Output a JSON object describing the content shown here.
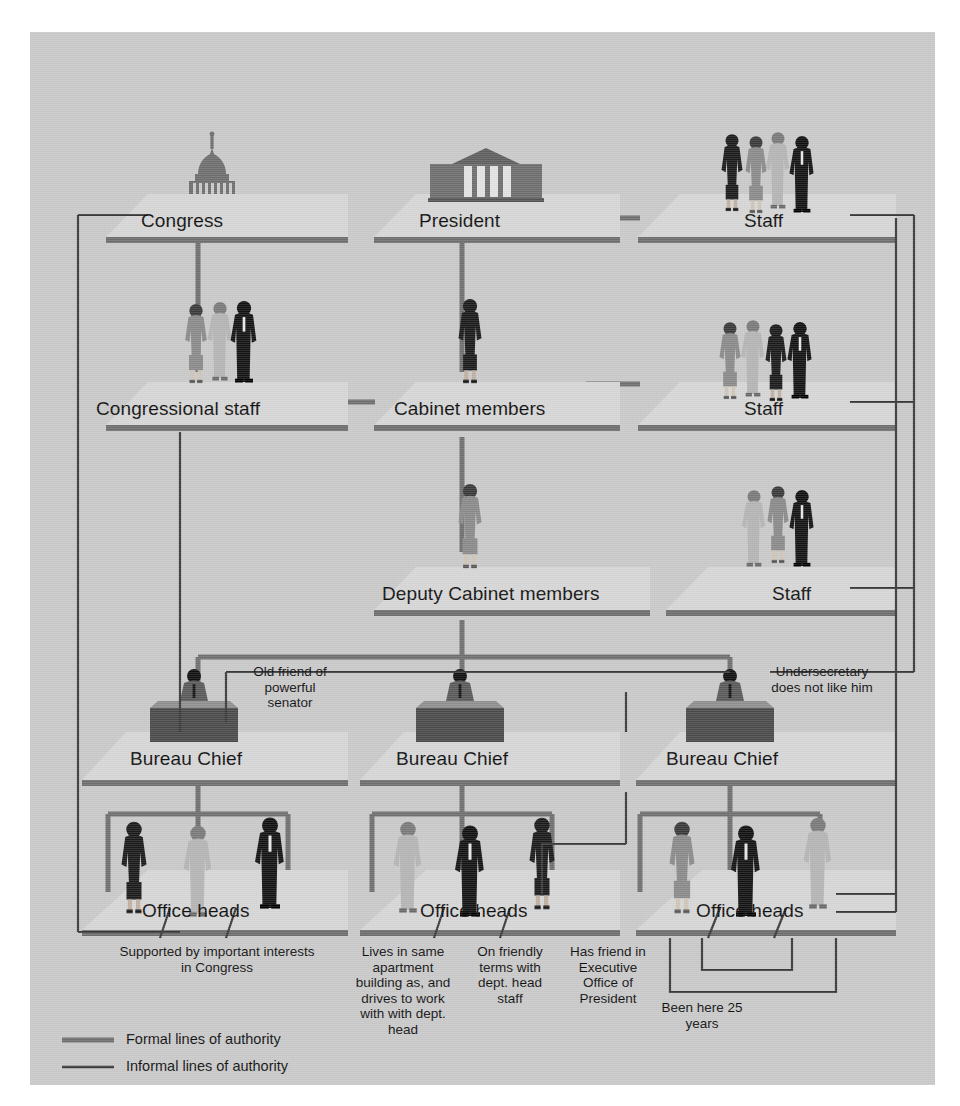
{
  "diagram": {
    "colors": {
      "canvas_bg": "#c9c9c9",
      "platform_top": "#d2d2d2",
      "platform_edge": "#6e6e6e",
      "formal_line": "#6f6f6f",
      "informal_line": "#3a3a3a",
      "text": "#101010",
      "figure_dark": "#1b1b1b",
      "figure_mid": "#7a7a7a",
      "figure_light": "#b4b4b4"
    },
    "nodes": [
      {
        "id": "congress",
        "label": "Congress",
        "row": 1,
        "column": "left",
        "icon": "capitol-dome-icon"
      },
      {
        "id": "president",
        "label": "President",
        "row": 1,
        "column": "center",
        "icon": "white-house-icon"
      },
      {
        "id": "staff-top",
        "label": "Staff",
        "row": 1,
        "column": "right",
        "icon": "staff-group-icon"
      },
      {
        "id": "congressional-staff",
        "label": "Congressional staff",
        "row": 2,
        "column": "left",
        "icon": "staff-group-icon"
      },
      {
        "id": "cabinet-members",
        "label": "Cabinet members",
        "row": 2,
        "column": "center",
        "icon": "businesswoman-icon"
      },
      {
        "id": "staff-mid",
        "label": "Staff",
        "row": 2,
        "column": "right",
        "icon": "staff-group-icon"
      },
      {
        "id": "deputy-cabinet",
        "label": "Deputy Cabinet members",
        "row": 3,
        "column": "center",
        "icon": "businesswoman-icon"
      },
      {
        "id": "staff-deputy",
        "label": "Staff",
        "row": 3,
        "column": "right",
        "icon": "staff-group-icon"
      },
      {
        "id": "bureau-chief-left",
        "label": "Bureau Chief",
        "row": 4,
        "column": "left",
        "icon": "desk-officer-icon"
      },
      {
        "id": "bureau-chief-center",
        "label": "Bureau Chief",
        "row": 4,
        "column": "center",
        "icon": "desk-officer-icon"
      },
      {
        "id": "bureau-chief-right",
        "label": "Bureau Chief",
        "row": 4,
        "column": "right",
        "icon": "desk-officer-icon"
      },
      {
        "id": "office-heads-left",
        "label": "Office heads",
        "row": 5,
        "column": "left",
        "icon": "three-people-icon"
      },
      {
        "id": "office-heads-center",
        "label": "Office heads",
        "row": 5,
        "column": "center",
        "icon": "three-people-icon"
      },
      {
        "id": "office-heads-right",
        "label": "Office heads",
        "row": 5,
        "column": "right",
        "icon": "three-people-icon"
      }
    ],
    "annotations": [
      {
        "id": "ann-old-friend",
        "text": "Old friend of powerful senator",
        "attached_to": "bureau-chief-left"
      },
      {
        "id": "ann-undersecretary",
        "text": "Undersecretary does not like him",
        "attached_to": "bureau-chief-right"
      },
      {
        "id": "ann-supported-by",
        "text": "Supported by important interests in Congress",
        "attached_to": "office-heads-left"
      },
      {
        "id": "ann-lives-in-same",
        "text": "Lives in same apartment building as, and drives to work with with dept. head",
        "attached_to": "office-heads-center"
      },
      {
        "id": "ann-friendly-terms",
        "text": "On friendly terms with dept. head staff",
        "attached_to": "office-heads-center"
      },
      {
        "id": "ann-executive-office",
        "text": "Has friend in Executive Office of President",
        "attached_to": "office-heads-center"
      },
      {
        "id": "ann-been-here",
        "text": "Been here 25 years",
        "attached_to": "office-heads-right"
      }
    ],
    "legend": {
      "items": [
        {
          "id": "legend-formal",
          "label": "Formal lines of authority",
          "style": "thick-gray",
          "color": "#6f6f6f"
        },
        {
          "id": "legend-informal",
          "label": "Informal lines of authority",
          "style": "thin-dark",
          "color": "#3a3a3a"
        }
      ]
    }
  },
  "annotation_lines": {
    "old_friend": [
      "Old friend of",
      "powerful",
      "senator"
    ],
    "undersecretary": [
      "Undersecretary",
      "does not like him"
    ],
    "supported_by": [
      "Supported by important interests",
      "in Congress"
    ],
    "lives_in_same": [
      "Lives in same",
      "apartment",
      "building as, and",
      "drives to work",
      "with with dept.",
      "head"
    ],
    "friendly_terms": [
      "On friendly",
      "terms with",
      "dept. head",
      "staff"
    ],
    "executive_office": [
      "Has friend in",
      "Executive",
      "Office of",
      "President"
    ],
    "been_here": [
      "Been here 25",
      "years"
    ]
  }
}
